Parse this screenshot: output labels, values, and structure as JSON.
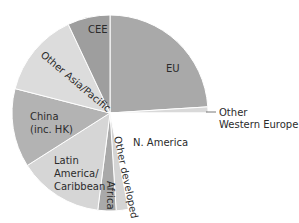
{
  "chart_data": {
    "type": "pie",
    "title": "",
    "start_angle_deg": 0,
    "direction": "clockwise",
    "slices": [
      {
        "label": "EU",
        "value": 24,
        "color": "#a9a9a9"
      },
      {
        "label": "Other Western Europe",
        "value": 1,
        "color": "#d9d9d9"
      },
      {
        "label": "N. America",
        "value": 22,
        "color": "#ffffff"
      },
      {
        "label": "Other developed",
        "value": 2,
        "color": "#d4d4d4"
      },
      {
        "label": "Africa",
        "value": 3,
        "color": "#a9a9a9"
      },
      {
        "label": "Latin America/ Caribbean",
        "value": 14,
        "color": "#d6d6d6"
      },
      {
        "label": "China (inc. HK)",
        "value": 13,
        "color": "#b3b3b3"
      },
      {
        "label": "Other Asia/Pacific",
        "value": 14,
        "color": "#dcdcdc"
      },
      {
        "label": "CEE",
        "value": 7,
        "color": "#9e9e9e"
      }
    ],
    "legend": "none",
    "annotations": [
      "Other Western Europe (callout line)"
    ]
  },
  "labels": {
    "eu": "EU",
    "other_western_europe_1": "Other",
    "other_western_europe_2": "Western Europe",
    "n_america": "N. America",
    "other_developed": "Other developed",
    "africa": "Africa",
    "latin_america_1": "Latin",
    "latin_america_2": "America/",
    "latin_america_3": "Caribbean",
    "china_1": "China",
    "china_2": "(inc. HK)",
    "other_asia_pacific": "Other Asia/Pacific",
    "cee": "CEE"
  }
}
